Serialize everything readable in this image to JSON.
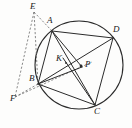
{
  "figure": {
    "type": "geometry-diagram",
    "width": 132,
    "height": 128,
    "background_color": "#fdfdfc",
    "stroke_color": "#2b2b2b",
    "dashed_stroke_color": "#6d6d6d",
    "label_color": "#1a1a1a"
  },
  "circle": {
    "name": "circumcircle",
    "cx": 79,
    "cy": 65,
    "r": 44,
    "stroke": "#2b2b2b",
    "stroke_width": 1.1
  },
  "points": [
    {
      "id": "A",
      "label": "A",
      "x": 52,
      "y": 31,
      "label_x": 47,
      "label_y": 18,
      "on_circle": true,
      "dot": false
    },
    {
      "id": "D",
      "label": "D",
      "x": 113,
      "y": 38,
      "label_x": 113,
      "label_y": 27,
      "on_circle": true,
      "dot": false
    },
    {
      "id": "C",
      "label": "C",
      "x": 95,
      "y": 105,
      "label_x": 94,
      "label_y": 107,
      "on_circle": true,
      "dot": false
    },
    {
      "id": "B",
      "label": "B",
      "x": 38,
      "y": 84,
      "label_x": 29,
      "label_y": 74,
      "on_circle": true,
      "dot": false
    },
    {
      "id": "E",
      "label": "E",
      "x": 34,
      "y": 12,
      "label_x": 30,
      "label_y": 3,
      "on_circle": false,
      "dot": false
    },
    {
      "id": "F",
      "label": "F",
      "x": 15,
      "y": 97,
      "label_x": 10,
      "label_y": 95,
      "on_circle": false,
      "dot": false
    },
    {
      "id": "K",
      "label": "K",
      "x": 66,
      "y": 63,
      "label_x": 56,
      "label_y": 55,
      "on_circle": false,
      "dot": true
    },
    {
      "id": "P",
      "label": "P",
      "x": 80,
      "y": 66,
      "label_x": 85,
      "label_y": 61,
      "on_circle": false,
      "dot": true
    }
  ],
  "segments": [
    {
      "id": "AD",
      "from": "A",
      "to": "D",
      "style": "solid"
    },
    {
      "id": "AB",
      "from": "A",
      "to": "B",
      "style": "solid"
    },
    {
      "id": "AC",
      "from": "A",
      "to": "C",
      "style": "solid"
    },
    {
      "id": "AP",
      "from": "A",
      "to": "P",
      "style": "solid"
    },
    {
      "id": "BD",
      "from": "B",
      "to": "D",
      "style": "solid"
    },
    {
      "id": "BC",
      "from": "B",
      "to": "C",
      "style": "solid"
    },
    {
      "id": "BP",
      "from": "B",
      "to": "P",
      "style": "solid"
    },
    {
      "id": "CD",
      "from": "C",
      "to": "D",
      "style": "solid"
    },
    {
      "id": "CK",
      "from": "C",
      "to": "K",
      "style": "solid"
    },
    {
      "id": "EA",
      "from": "E",
      "to": "A",
      "style": "dashed"
    },
    {
      "id": "EB",
      "from": "E",
      "to": "B",
      "style": "dashed"
    },
    {
      "id": "EF",
      "from": "E",
      "to": "F",
      "style": "dashed"
    },
    {
      "id": "FB",
      "from": "F",
      "to": "B",
      "style": "dashed"
    },
    {
      "id": "FP",
      "from": "F",
      "to": "P",
      "style": "dashed"
    }
  ],
  "caption": ""
}
